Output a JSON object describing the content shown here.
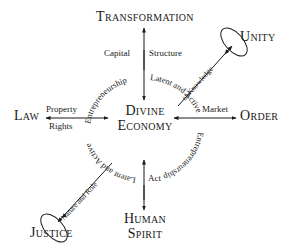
{
  "center": {
    "line1": "Divine",
    "line2": "Economy"
  },
  "nodes": {
    "top": "Transformation",
    "top_right": "Unity",
    "left": "Law",
    "right": "Order",
    "bottom_left": "Justice",
    "bottom_line1": "Human",
    "bottom_line2": "Spirit"
  },
  "edge_labels": {
    "top_left": "Capital",
    "top_right": "Structure",
    "left_top": "Property",
    "left_bottom": "Rights",
    "right": "Market",
    "bottom": "Act",
    "diag_up": "of Knowledge",
    "diag_down": "Nature and Role"
  },
  "ring_text": {
    "upper_left": "Entrepreneurship",
    "upper_right": "Latent and Active",
    "right": "Entrepreneurship",
    "lower_left": "Latent and Active"
  },
  "colors": {
    "ink": "#1a1a1a",
    "background": "#ffffff"
  }
}
